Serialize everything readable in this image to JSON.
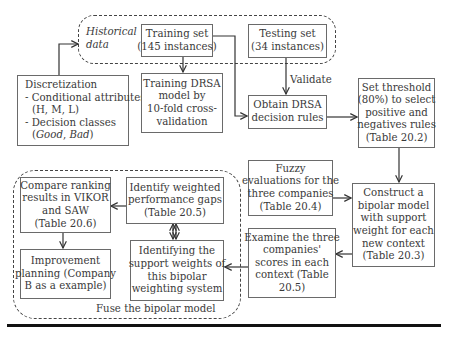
{
  "diagram": {
    "groups": {
      "historical": {
        "label_line1": "Historical",
        "label_line2": "data"
      },
      "fuse": {
        "label": "Fuse the bipolar model"
      }
    },
    "nodes": {
      "training_set": {
        "lines": [
          "Training set",
          "(145 instances)"
        ]
      },
      "testing_set": {
        "lines": [
          "Testing set",
          "(34 instances)"
        ]
      },
      "discretization": {
        "lines": [
          "Discretization",
          "- Conditional attributes",
          "(H, M, L)",
          "- Decision classes"
        ],
        "italic_line_open": "(",
        "italic_good": "Good",
        "italic_sep": ", ",
        "italic_bad": "Bad",
        "italic_line_close": ")"
      },
      "training_drsa": {
        "lines": [
          "Training DRSA",
          "model by",
          "10-fold cross-",
          "validation"
        ]
      },
      "obtain_rules": {
        "lines": [
          "Obtain DRSA",
          "decision rules"
        ]
      },
      "set_threshold": {
        "lines": [
          "Set threshold",
          "(80%) to select",
          "positive and",
          "negatives rules",
          "(Table 20.2)"
        ]
      },
      "fuzzy_eval": {
        "lines": [
          "Fuzzy",
          "evaluations for the",
          "three companies",
          "(Table 20.4)"
        ]
      },
      "construct_bipolar": {
        "lines": [
          "Construct a",
          "bipolar model",
          "with support",
          "weight for each",
          "new context",
          "(Table 20.3)"
        ]
      },
      "examine_scores": {
        "lines": [
          "Examine the three",
          "companies'",
          "scores in each",
          "context (Table",
          "20.5)"
        ]
      },
      "compare_ranking": {
        "lines": [
          "Compare ranking",
          "results in VIKOR",
          "and SAW",
          "(Table 20.6)"
        ]
      },
      "identify_gaps": {
        "lines": [
          "Identify weighted",
          "performance gaps",
          "(Table 20.5)"
        ]
      },
      "improvement": {
        "lines": [
          "Improvement",
          "planning (Company",
          "B as a example)"
        ]
      },
      "support_weights": {
        "lines": [
          "Identifying the",
          "support weights of",
          "this bipolar",
          "weighting system"
        ]
      }
    },
    "edge_labels": {
      "validate": "Validate"
    },
    "colors": {
      "border": "#6a6a6a",
      "dash": "#444444",
      "text": "#3a3a3a",
      "rule": "#111111"
    }
  }
}
